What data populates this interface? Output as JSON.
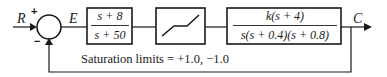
{
  "diagram": {
    "type": "block-diagram",
    "input_label": "R",
    "output_label": "C",
    "error_label": "E",
    "summing_junction": {
      "plus_sign": "+",
      "minus_sign": "−"
    },
    "blocks": [
      {
        "name": "compensator",
        "numerator": "s + 8",
        "denominator": "s + 50"
      },
      {
        "name": "saturation",
        "symbol": "saturation-nonlinearity"
      },
      {
        "name": "plant",
        "numerator": "k(s + 4)",
        "denominator": "s(s + 0.4)(s + 0.8)"
      }
    ],
    "feedback": "unity negative feedback",
    "annotation": "Saturation limits = +1.0, −1.0"
  },
  "colors": {
    "line": "#1a1a1a",
    "background": "#ffffff"
  }
}
